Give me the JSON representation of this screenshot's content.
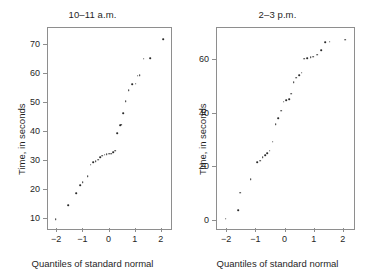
{
  "figure": {
    "background": "#ffffff",
    "point_color": "#2b2b2b",
    "axis_color": "#8e8e8e"
  },
  "panels": [
    {
      "title": "10–11 a.m.",
      "xlabel": "Quantiles of standard normal",
      "ylabel": "Time, in seconds",
      "xticks": [
        "−2",
        "−1",
        "0",
        "1",
        "2"
      ],
      "yticks": [
        "10",
        "20",
        "30",
        "40",
        "50",
        "60",
        "70"
      ]
    },
    {
      "title": "2–3 p.m.",
      "xlabel": "Quantiles of standard normal",
      "ylabel": "Time, in seconds",
      "xticks": [
        "−2",
        "−1",
        "0",
        "1",
        "2"
      ],
      "yticks": [
        "0",
        "20",
        "40",
        "60"
      ]
    }
  ],
  "chart_data": [
    {
      "type": "scatter",
      "title": "10–11 a.m.",
      "xlabel": "Quantiles of standard normal",
      "ylabel": "Time, in seconds",
      "grid": false,
      "legend": "none",
      "xlim": [
        -2.35,
        2.35
      ],
      "ylim": [
        6.5,
        76
      ],
      "xticks": [
        -2,
        -1,
        0,
        1,
        2
      ],
      "yticks": [
        10,
        20,
        30,
        40,
        50,
        60,
        70
      ],
      "x": [
        -2.05,
        -1.58,
        -1.28,
        -1.13,
        -1.02,
        -0.83,
        -0.72,
        -0.62,
        -0.53,
        -0.44,
        -0.35,
        -0.27,
        -0.18,
        -0.1,
        -0.02,
        0.06,
        0.14,
        0.22,
        0.3,
        0.4,
        0.45,
        0.52,
        0.62,
        0.74,
        0.86,
        1.0,
        1.07,
        1.16,
        1.3,
        1.55,
        2.05
      ],
      "y": [
        9.8,
        14.8,
        18.8,
        21.6,
        22.7,
        24.8,
        28.8,
        29.5,
        30.0,
        30.5,
        31.3,
        31.8,
        32.2,
        32.4,
        32.5,
        32.6,
        33.0,
        33.6,
        39.6,
        42.4,
        42.6,
        46.6,
        50.6,
        54.5,
        56.5,
        56.8,
        59.5,
        59.6,
        65.4,
        65.5,
        72.2
      ]
    },
    {
      "type": "scatter",
      "title": "2–3 p.m.",
      "xlabel": "Quantiles of standard normal",
      "ylabel": "Time, in seconds",
      "grid": false,
      "legend": "none",
      "xlim": [
        -2.35,
        2.35
      ],
      "ylim": [
        -3,
        72
      ],
      "xticks": [
        -2,
        -1,
        0,
        1,
        2
      ],
      "yticks": [
        0,
        20,
        40,
        60
      ],
      "x": [
        -2.05,
        -1.62,
        -1.55,
        -1.2,
        -0.97,
        -0.86,
        -0.78,
        -0.7,
        -0.62,
        -0.54,
        -0.44,
        -0.34,
        -0.25,
        -0.15,
        -0.06,
        0.03,
        0.12,
        0.2,
        0.28,
        0.37,
        0.46,
        0.55,
        0.64,
        0.74,
        0.86,
        0.96,
        1.08,
        1.22,
        1.37,
        1.52,
        2.05
      ],
      "y": [
        0.8,
        4.0,
        10.6,
        15.6,
        22.0,
        22.5,
        23.8,
        24.5,
        25.3,
        26.2,
        29.5,
        36.0,
        38.3,
        41.2,
        44.5,
        45.0,
        45.4,
        47.5,
        51.8,
        53.5,
        54.4,
        55.3,
        60.6,
        60.8,
        61.0,
        61.3,
        62.0,
        63.8,
        66.8,
        66.9,
        67.6
      ]
    }
  ]
}
